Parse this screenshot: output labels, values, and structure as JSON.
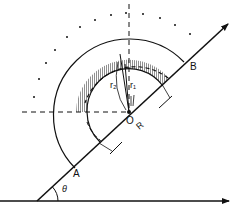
{
  "diagram": {
    "type": "physics-geometry",
    "labels": {
      "point_a": "A",
      "point_b": "B",
      "origin": "O",
      "radius_R": "R",
      "radius_r1": "r₁",
      "radius_r2": "r₂",
      "angle": "θ"
    },
    "colors": {
      "stroke": "#111111",
      "background": "#ffffff",
      "hatch": "#222222"
    }
  }
}
